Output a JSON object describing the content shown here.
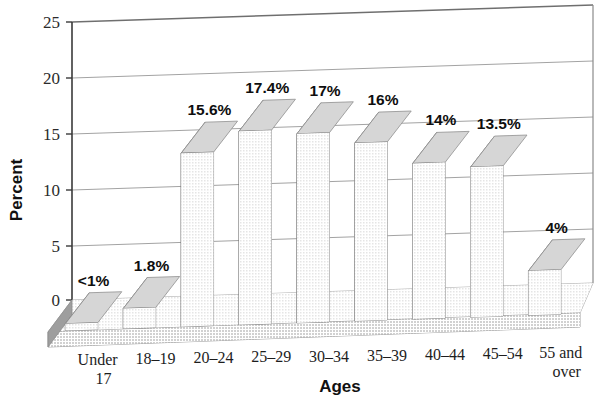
{
  "chart_data": {
    "type": "bar",
    "title": "",
    "subtitle": "",
    "xlabel": "Ages",
    "ylabel": "Percent",
    "categories": [
      "Under 17",
      "18–19",
      "20–24",
      "25–29",
      "30–34",
      "35–39",
      "40–44",
      "45–54",
      "55 and over"
    ],
    "category_lines": [
      [
        "Under",
        "17"
      ],
      [
        "18–19",
        ""
      ],
      [
        "20–24",
        ""
      ],
      [
        "25–29",
        ""
      ],
      [
        "30–34",
        ""
      ],
      [
        "35–39",
        ""
      ],
      [
        "40–44",
        ""
      ],
      [
        "45–54",
        ""
      ],
      [
        "55 and",
        "over"
      ]
    ],
    "values": [
      0.6,
      1.8,
      15.6,
      17.4,
      17.0,
      16.0,
      14.0,
      13.5,
      4.0
    ],
    "data_labels": [
      "<1%",
      "1.8%",
      "15.6%",
      "17.4%",
      "17%",
      "16%",
      "14%",
      "13.5%",
      "4%"
    ],
    "ylim": [
      0,
      25
    ],
    "yticks": [
      0,
      5,
      10,
      15,
      20,
      25
    ],
    "ytick_labels": [
      "0",
      "5",
      "10",
      "15",
      "20",
      "25"
    ],
    "grid": true,
    "legend": "none",
    "style": "3d-column",
    "colors": {
      "bar_front": "#a9a9a9",
      "bar_top": "#d6d6d6",
      "bar_side": "#8f8f8f",
      "floor_top": "#cfcfcf",
      "floor_front": "#b4b4b4",
      "gridline": "#9a9a9a",
      "axis": "#3a3a3a",
      "text": "#1b1b1b",
      "background": "#ffffff"
    }
  }
}
